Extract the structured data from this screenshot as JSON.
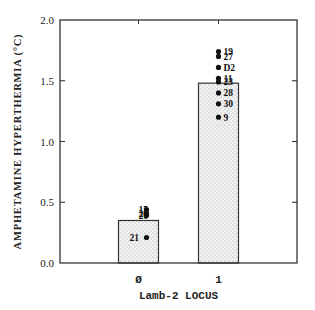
{
  "chart_data": {
    "type": "bar",
    "title": "",
    "xlabel": "Lamb-2 LOCUS",
    "ylabel": "AMPHETAMINE HYPERTHERMIA (°C)",
    "ylim": [
      0.0,
      2.0
    ],
    "yticks": [
      "0.0",
      "0.5",
      "1.0",
      "1.5",
      "2.0"
    ],
    "grid": false,
    "legend": null,
    "categories": [
      "0",
      "1"
    ],
    "values": [
      0.35,
      1.48
    ],
    "bar_fill": "dotted gray stipple",
    "points": [
      {
        "category": "0",
        "label": "15",
        "value": 0.44
      },
      {
        "category": "0",
        "label": "26",
        "value": 0.41
      },
      {
        "category": "0",
        "label": "20",
        "value": 0.39
      },
      {
        "category": "0",
        "label": "21",
        "value": 0.21
      },
      {
        "category": "1",
        "label": "19",
        "value": 1.74
      },
      {
        "category": "1",
        "label": "27",
        "value": 1.7
      },
      {
        "category": "1",
        "label": "D2",
        "value": 1.61
      },
      {
        "category": "1",
        "label": "11",
        "value": 1.52
      },
      {
        "category": "1",
        "label": "23",
        "value": 1.49
      },
      {
        "category": "1",
        "label": "28",
        "value": 1.4
      },
      {
        "category": "1",
        "label": "30",
        "value": 1.31
      },
      {
        "category": "1",
        "label": "9",
        "value": 1.2
      }
    ]
  },
  "labels": {
    "ylabel": "AMPHETAMINE HYPERTHERMIA (°C)",
    "xlabel": "Lamb-2 LOCUS"
  }
}
